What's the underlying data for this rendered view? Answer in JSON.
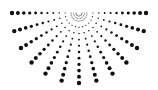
{
  "graphic": {
    "name": "radial-dot-sunburst",
    "center": [
      79,
      13
    ],
    "ray_count": 13,
    "angle_start_deg": 0,
    "angle_end_deg": 180,
    "radius_x": 67,
    "radius_y": 70,
    "dots_per_ray": 11,
    "inner_radius": 8,
    "min_dot_r": 0.5,
    "max_dot_r": 2.2,
    "dot_color": "#111111",
    "background": "#ffffff"
  }
}
